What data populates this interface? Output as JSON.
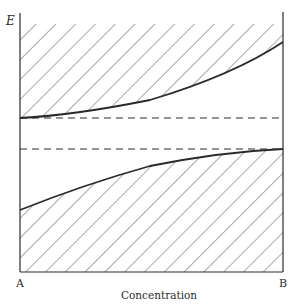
{
  "diagram": {
    "title": "",
    "y_axis_label": "E",
    "x_axis_label": "Concentration",
    "left_end_label": "A",
    "right_end_label": "B",
    "colors": {
      "ink": "#2a2a2a",
      "hatch": "#555555",
      "background": "#ffffff"
    },
    "regions": [
      {
        "name": "upper-hatched-band",
        "fill": "diagonal-hatch"
      },
      {
        "name": "lower-hatched-band",
        "fill": "diagonal-hatch"
      }
    ],
    "curves": [
      {
        "name": "upper-band-edge",
        "style": "solid",
        "points": [
          [
            20,
            118
          ],
          [
            60,
            114
          ],
          [
            100,
            109
          ],
          [
            150,
            100
          ],
          [
            200,
            84
          ],
          [
            240,
            68
          ],
          [
            283,
            42
          ]
        ]
      },
      {
        "name": "lower-band-edge",
        "style": "solid",
        "points": [
          [
            20,
            210
          ],
          [
            60,
            194
          ],
          [
            100,
            180
          ],
          [
            150,
            166
          ],
          [
            200,
            157
          ],
          [
            240,
            151
          ],
          [
            283,
            149
          ]
        ]
      }
    ],
    "dashed_lines": [
      {
        "name": "upper-reference-level",
        "y": 118
      },
      {
        "name": "lower-reference-level",
        "y": 149
      }
    ]
  }
}
